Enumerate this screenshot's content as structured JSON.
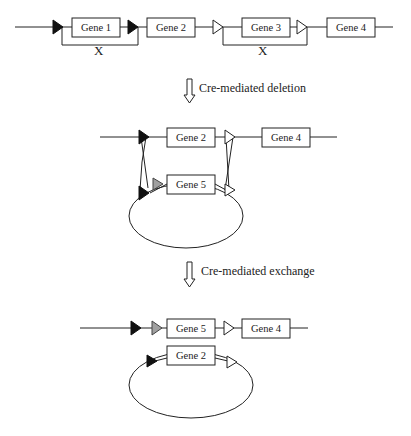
{
  "colors": {
    "lox_black": "#111111",
    "lox_open": "#ffffff",
    "lox_gray": "#a0a0a0",
    "line": "#222222"
  },
  "stage1": {
    "genes": [
      {
        "label": "Gene 1"
      },
      {
        "label": "Gene 2"
      },
      {
        "label": "Gene 3"
      },
      {
        "label": "Gene 4"
      }
    ],
    "sites": [
      "black-loxP",
      "black-loxP",
      "open-lox",
      "open-lox"
    ],
    "crossovers": [
      "X",
      "X"
    ]
  },
  "arrow1": {
    "label": "Cre-mediated deletion"
  },
  "stage2": {
    "chromosome_genes": [
      {
        "label": "Gene 2"
      },
      {
        "label": "Gene 4"
      }
    ],
    "plasmid_genes": [
      {
        "label": "Gene 5"
      }
    ]
  },
  "arrow2": {
    "label": "Cre-mediated exchange"
  },
  "stage3": {
    "chromosome_genes": [
      {
        "label": "Gene 5"
      },
      {
        "label": "Gene 4"
      }
    ],
    "plasmid_genes": [
      {
        "label": "Gene 2"
      }
    ]
  }
}
